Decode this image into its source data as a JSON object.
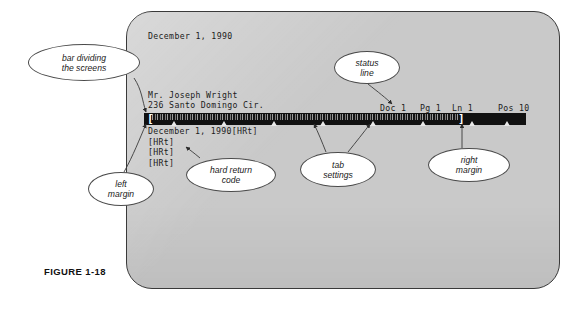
{
  "figure": {
    "caption": "FIGURE 1-18"
  },
  "screen": {
    "document": {
      "date_line": "December 1, 1990",
      "address_name": "Mr. Joseph Wright",
      "address_street": "236 Santo Domingo Cir."
    },
    "status_line": {
      "doc": "Doc 1",
      "pg": "Pg 1",
      "ln": "Ln 1",
      "pos": "Pos 10"
    },
    "ruler": {
      "left_margin_bracket": "[",
      "right_margin_bracket": "]",
      "tab_positions_pct": [
        8,
        21,
        34,
        47,
        60,
        73,
        86,
        95
      ]
    },
    "reveal_codes": [
      "December 1, 1990[HRt]",
      "[HRt]",
      "[HRt]",
      "[HRt]"
    ]
  },
  "callouts": {
    "bar_dividing": {
      "line1": "bar dividing",
      "line2": "the screens"
    },
    "status_line": {
      "line1": "status",
      "line2": "line"
    },
    "left_margin": {
      "line1": "left",
      "line2": "margin"
    },
    "hard_return": {
      "line1": "hard return",
      "line2": "code"
    },
    "tab_settings": {
      "line1": "tab",
      "line2": "settings"
    },
    "right_margin": {
      "line1": "right",
      "line2": "margin"
    }
  },
  "colors": {
    "screen_fill": "#c9c9c9",
    "screen_border": "#3a3a3a",
    "ruler_bar": "#111111",
    "terminal_text": "#1b1b1b",
    "callout_border": "#4a4a4a",
    "page_background": "#ffffff"
  }
}
